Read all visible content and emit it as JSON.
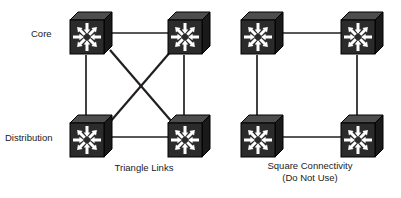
{
  "diagram": {
    "background_color": "#ffffff",
    "link_color": "#231f20",
    "switch_body_color": "#2b2b2b",
    "switch_top_color": "#4d4d4d",
    "switch_side_color": "#1a1a1a",
    "switch_arrow_color": "#ffffff",
    "text_color": "#1a1a1a"
  },
  "row_labels": [
    {
      "id": "core",
      "text": "Core",
      "x": 31,
      "y": 28
    },
    {
      "id": "distribution",
      "text": "Distribution",
      "x": 5,
      "y": 132
    }
  ],
  "groups": [
    {
      "id": "triangle",
      "caption_lines": [
        "Triangle Links"
      ],
      "caption_x": 144,
      "caption_y": 162,
      "nodes": [
        {
          "id": "tri-core-left",
          "name": "core-switch-left",
          "role": "core",
          "cx": 90,
          "cy": 34
        },
        {
          "id": "tri-core-right",
          "name": "core-switch-right",
          "role": "core",
          "cx": 188,
          "cy": 34
        },
        {
          "id": "tri-dist-left",
          "name": "distribution-switch-left",
          "role": "distribution",
          "cx": 90,
          "cy": 137
        },
        {
          "id": "tri-dist-right",
          "name": "distribution-switch-right",
          "role": "distribution",
          "cx": 188,
          "cy": 137
        }
      ],
      "links": [
        {
          "id": "tri-top",
          "kind": "horizontal",
          "from": "tri-core-left",
          "to": "tri-core-right",
          "x1": 110,
          "y1": 33,
          "x2": 168,
          "y2": 33
        },
        {
          "id": "tri-left",
          "kind": "vertical",
          "from": "tri-core-left",
          "to": "tri-dist-left",
          "x1": 86,
          "y1": 55,
          "x2": 86,
          "y2": 119
        },
        {
          "id": "tri-right",
          "kind": "vertical",
          "from": "tri-core-right",
          "to": "tri-dist-right",
          "x1": 184,
          "y1": 55,
          "x2": 184,
          "y2": 119
        },
        {
          "id": "tri-bottom",
          "kind": "horizontal",
          "from": "tri-dist-left",
          "to": "tri-dist-right",
          "x1": 110,
          "y1": 137,
          "x2": 168,
          "y2": 137
        },
        {
          "id": "tri-diag-1",
          "kind": "diagonal",
          "from": "tri-core-left",
          "to": "tri-dist-right",
          "x1": 110,
          "y1": 50,
          "x2": 172,
          "y2": 122
        },
        {
          "id": "tri-diag-2",
          "kind": "diagonal",
          "from": "tri-core-right",
          "to": "tri-dist-left",
          "x1": 172,
          "y1": 50,
          "x2": 110,
          "y2": 122
        }
      ]
    },
    {
      "id": "square",
      "caption_lines": [
        "Square Connectivity",
        "(Do Not Use)"
      ],
      "caption_x": 310,
      "caption_y": 160,
      "nodes": [
        {
          "id": "sq-core-left",
          "name": "core-switch-left",
          "role": "core",
          "cx": 261,
          "cy": 34
        },
        {
          "id": "sq-core-right",
          "name": "core-switch-right",
          "role": "core",
          "cx": 361,
          "cy": 34
        },
        {
          "id": "sq-dist-left",
          "name": "distribution-switch-left",
          "role": "distribution",
          "cx": 261,
          "cy": 137
        },
        {
          "id": "sq-dist-right",
          "name": "distribution-switch-right",
          "role": "distribution",
          "cx": 361,
          "cy": 137
        }
      ],
      "links": [
        {
          "id": "sq-top",
          "kind": "horizontal",
          "from": "sq-core-left",
          "to": "sq-core-right",
          "x1": 281,
          "y1": 33,
          "x2": 341,
          "y2": 33
        },
        {
          "id": "sq-left",
          "kind": "vertical",
          "from": "sq-core-left",
          "to": "sq-dist-left",
          "x1": 257,
          "y1": 55,
          "x2": 257,
          "y2": 119
        },
        {
          "id": "sq-right",
          "kind": "vertical",
          "from": "sq-core-right",
          "to": "sq-dist-right",
          "x1": 357,
          "y1": 55,
          "x2": 357,
          "y2": 119
        },
        {
          "id": "sq-bottom",
          "kind": "horizontal",
          "from": "sq-dist-left",
          "to": "sq-dist-right",
          "x1": 281,
          "y1": 137,
          "x2": 341,
          "y2": 137
        }
      ]
    }
  ],
  "icon": {
    "name": "multilayer-switch-icon",
    "arrow_count": 8,
    "description": "multilayer switch"
  }
}
